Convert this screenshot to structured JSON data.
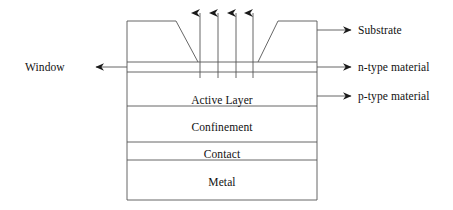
{
  "diagram": {
    "stroke_color": "#555555",
    "arrow_color": "#1a1a1a",
    "text_color": "#111111",
    "background_color": "#ffffff",
    "layers": [
      {
        "id": "substrate",
        "label": "Substrate"
      },
      {
        "id": "active-layer",
        "label": "Active Layer"
      },
      {
        "id": "confinement",
        "label": "Confinement"
      },
      {
        "id": "contact",
        "label": "Contact"
      },
      {
        "id": "metal",
        "label": "Metal"
      }
    ],
    "interior_labels": [
      {
        "id": "active-layer",
        "label": "Active Layer"
      },
      {
        "id": "confinement",
        "label": "Confinement"
      },
      {
        "id": "contact",
        "label": "Contact"
      },
      {
        "id": "metal",
        "label": "Metal"
      }
    ],
    "callouts_right": [
      {
        "id": "substrate",
        "label": "Substrate"
      },
      {
        "id": "n-type-material",
        "label": "n-type material"
      },
      {
        "id": "p-type-material",
        "label": "p-type material"
      }
    ],
    "callouts_left": [
      {
        "id": "window",
        "label": "Window"
      }
    ],
    "emission_arrows": {
      "count": 4,
      "direction": "up",
      "description": "light emission"
    }
  }
}
